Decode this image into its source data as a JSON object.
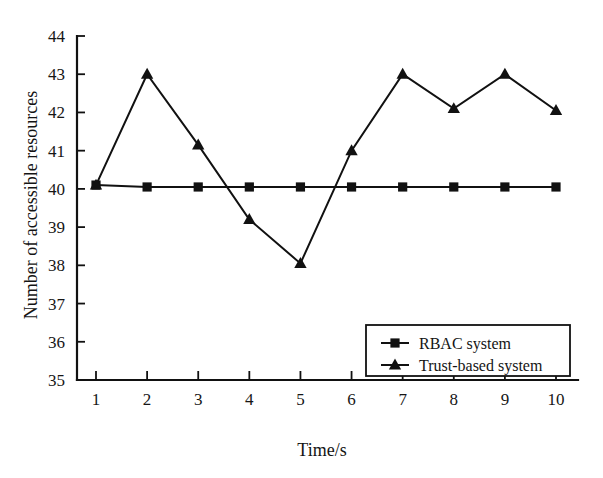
{
  "chart_data": {
    "type": "line",
    "title": "",
    "xlabel": "Time/s",
    "ylabel": "Number of accessible resources",
    "x": [
      1,
      2,
      3,
      4,
      5,
      6,
      7,
      8,
      9,
      10
    ],
    "xtick_labels": [
      "1",
      "2",
      "3",
      "4",
      "5",
      "6",
      "7",
      "8",
      "9",
      "10"
    ],
    "ytick_labels": [
      "35",
      "36",
      "37",
      "38",
      "39",
      "40",
      "41",
      "42",
      "43",
      "44"
    ],
    "yticks": [
      35,
      36,
      37,
      38,
      39,
      40,
      41,
      42,
      43,
      44
    ],
    "ylim": [
      35,
      44
    ],
    "xlim": [
      1,
      10
    ],
    "grid": false,
    "legend_position": "lower-right",
    "series": [
      {
        "name": "RBAC system",
        "marker": "square",
        "values": [
          40.1,
          40.05,
          40.05,
          40.05,
          40.05,
          40.05,
          40.05,
          40.05,
          40.05,
          40.05
        ]
      },
      {
        "name": "Trust-based system",
        "marker": "triangle",
        "values": [
          40.1,
          43.0,
          41.15,
          39.2,
          38.05,
          41.0,
          43.0,
          42.1,
          43.0,
          42.05
        ]
      }
    ]
  },
  "legend": {
    "entries": [
      {
        "label": "RBAC system",
        "marker": "square"
      },
      {
        "label": "Trust-based system",
        "marker": "triangle"
      }
    ]
  },
  "axes": {
    "x_title": "Time/s",
    "y_title": "Number of accessible resources"
  }
}
